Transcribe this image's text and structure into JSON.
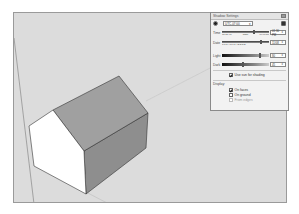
{
  "panel": {
    "title": "Shadow Settings",
    "close_icon": "close-icon",
    "sun_icon": "sun-icon",
    "timezone": "UTC-07:00",
    "show_shadows_icon": "shadow-toggle-icon",
    "time": {
      "label": "Time",
      "scale_start": "06:43 AM",
      "scale_noon": "Noon",
      "scale_end": "04:46 PM",
      "value": "01:30 PM",
      "slider_fraction": 0.68
    },
    "date": {
      "label": "Date",
      "scale": "J F M A M J J A S O N D",
      "value": "11/08",
      "slider_fraction": 0.84
    },
    "light": {
      "label": "Light",
      "value": "80",
      "slider_fraction": 0.8
    },
    "dark": {
      "label": "Dark",
      "value": "45",
      "slider_fraction": 0.45
    },
    "use_sun_for_shading": {
      "label": "Use sun for shading",
      "checked": true
    },
    "display": {
      "label": "Display:",
      "options": [
        {
          "label": "On faces",
          "checked": true,
          "enabled": true
        },
        {
          "label": "On ground",
          "checked": false,
          "enabled": true
        },
        {
          "label": "From edges",
          "checked": false,
          "enabled": false
        }
      ]
    }
  },
  "colors": {
    "viewport_bg": "#dcdcdc",
    "roof": "#9e9e9e",
    "side_wall": "#8c8c8c",
    "gable_wall": "#ffffff",
    "edges": "#333333"
  }
}
